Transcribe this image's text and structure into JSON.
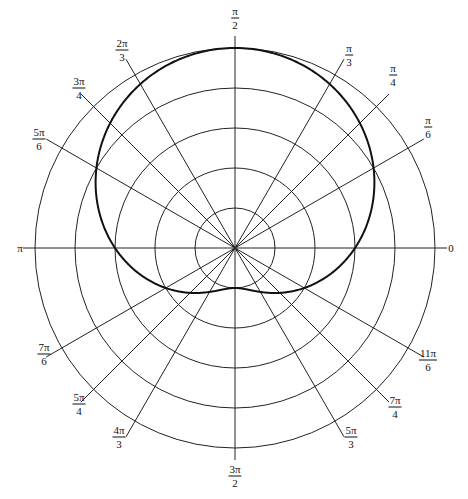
{
  "chart_data": {
    "type": "line",
    "subtype": "polar",
    "title": "",
    "equation": "r = 3 + 2 sin(theta)",
    "curve_name": "limacon",
    "r_grid": [
      1,
      2,
      3,
      4,
      5
    ],
    "r_max": 5,
    "angle_ticks": [
      {
        "angle_deg": 0,
        "label": "0",
        "num": "0",
        "den": ""
      },
      {
        "angle_deg": 30,
        "label": "π/6",
        "num": "π",
        "den": "6"
      },
      {
        "angle_deg": 45,
        "label": "π/4",
        "num": "π",
        "den": "4"
      },
      {
        "angle_deg": 60,
        "label": "π/3",
        "num": "π",
        "den": "3"
      },
      {
        "angle_deg": 90,
        "label": "π/2",
        "num": "π",
        "den": "2"
      },
      {
        "angle_deg": 120,
        "label": "2π/3",
        "num": "2π",
        "den": "3"
      },
      {
        "angle_deg": 135,
        "label": "3π/4",
        "num": "3π",
        "den": "4"
      },
      {
        "angle_deg": 150,
        "label": "5π/6",
        "num": "5π",
        "den": "6"
      },
      {
        "angle_deg": 180,
        "label": "π",
        "num": "π",
        "den": ""
      },
      {
        "angle_deg": 210,
        "label": "7π/6",
        "num": "7π",
        "den": "6"
      },
      {
        "angle_deg": 225,
        "label": "5π/4",
        "num": "5π",
        "den": "4"
      },
      {
        "angle_deg": 240,
        "label": "4π/3",
        "num": "4π",
        "den": "3"
      },
      {
        "angle_deg": 270,
        "label": "3π/2",
        "num": "3π",
        "den": "2"
      },
      {
        "angle_deg": 300,
        "label": "5π/3",
        "num": "5π",
        "den": "3"
      },
      {
        "angle_deg": 315,
        "label": "7π/4",
        "num": "7π",
        "den": "4"
      },
      {
        "angle_deg": 330,
        "label": "11π/6",
        "num": "11π",
        "den": "6"
      }
    ],
    "points": [
      {
        "theta": "0",
        "r": 3
      },
      {
        "theta": "π/6",
        "r": 4
      },
      {
        "theta": "π/4",
        "r": 4.41
      },
      {
        "theta": "π/3",
        "r": 4.73
      },
      {
        "theta": "π/2",
        "r": 5
      },
      {
        "theta": "2π/3",
        "r": 4.73
      },
      {
        "theta": "3π/4",
        "r": 4.41
      },
      {
        "theta": "5π/6",
        "r": 4
      },
      {
        "theta": "π",
        "r": 3
      },
      {
        "theta": "7π/6",
        "r": 2
      },
      {
        "theta": "5π/4",
        "r": 1.59
      },
      {
        "theta": "4π/3",
        "r": 1.27
      },
      {
        "theta": "3π/2",
        "r": 1
      },
      {
        "theta": "5π/3",
        "r": 1.27
      },
      {
        "theta": "7π/4",
        "r": 1.59
      },
      {
        "theta": "11π/6",
        "r": 2
      }
    ],
    "grid": true,
    "legend": null
  },
  "layout": {
    "center": [
      235,
      248
    ],
    "px_per_unit": 40,
    "ray_length": 218,
    "axis_length": 212,
    "colors": {
      "grid": "#222222",
      "curve": "#111111",
      "background": "#ffffff"
    },
    "label_positions": {
      "0": [
        451,
        248
      ],
      "30": [
        428,
        127
      ],
      "45": [
        393,
        75
      ],
      "60": [
        349,
        55
      ],
      "90": [
        235,
        18
      ],
      "120": [
        122,
        50
      ],
      "135": [
        79,
        88
      ],
      "150": [
        39,
        139
      ],
      "180": [
        20,
        248
      ],
      "210": [
        44,
        354
      ],
      "225": [
        79,
        404
      ],
      "240": [
        119,
        437
      ],
      "270": [
        235,
        476
      ],
      "300": [
        351,
        437
      ],
      "315": [
        395,
        407
      ],
      "330": [
        428,
        360
      ]
    }
  }
}
